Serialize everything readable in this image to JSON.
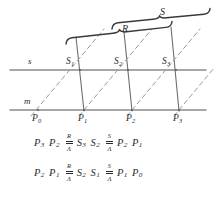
{
  "figure": {
    "lines": [
      {
        "id": "s",
        "label": "s",
        "role": "upper-horizontal-line",
        "y": 70
      },
      {
        "id": "m",
        "label": "m",
        "role": "lower-horizontal-line",
        "y": 110
      }
    ],
    "points_lower": [
      {
        "id": "P0",
        "base": "P",
        "sub": "0",
        "x": 38,
        "y": 110
      },
      {
        "id": "P1",
        "base": "P",
        "sub": "1",
        "x": 83,
        "y": 110
      },
      {
        "id": "P2",
        "base": "P",
        "sub": "2",
        "x": 131,
        "y": 110
      },
      {
        "id": "P3",
        "base": "P",
        "sub": "3",
        "x": 178,
        "y": 110
      }
    ],
    "points_upper": [
      {
        "id": "S1",
        "base": "S",
        "sub": "1",
        "x": 79,
        "y": 70
      },
      {
        "id": "S2",
        "base": "S",
        "sub": "2",
        "x": 128,
        "y": 70
      },
      {
        "id": "S3",
        "base": "S",
        "sub": "3",
        "x": 175,
        "y": 70
      }
    ],
    "braces": [
      {
        "id": "R",
        "label": "R",
        "label_x": 122,
        "label_y": 25,
        "x1": 66,
        "x2": 172,
        "y": 38,
        "peak_x": 120,
        "peak_y": 33,
        "tilt": -9
      },
      {
        "id": "S",
        "label": "S",
        "label_x": 175,
        "label_y": 8,
        "x1": 112,
        "x2": 210,
        "y": 24,
        "peak_x": 160,
        "peak_y": 19,
        "tilt": -9
      }
    ],
    "colors": {
      "ink": "#2b2b2b",
      "line_solid": "#8a8a8a",
      "line_dashed": "#9a9a9a",
      "brace": "#3a3a3a",
      "background": "#ffffff"
    }
  },
  "formulas": {
    "rows": [
      {
        "id": "formula-row-1",
        "terms": [
          {
            "kind": "point",
            "base": "P",
            "sub": "3"
          },
          {
            "kind": "point",
            "base": "P",
            "sub": "2"
          },
          {
            "kind": "projection",
            "top": "R",
            "bottom": "Λ"
          },
          {
            "kind": "point",
            "base": "S",
            "sub": "3"
          },
          {
            "kind": "point",
            "base": "S",
            "sub": "2"
          },
          {
            "kind": "projection",
            "top": "S",
            "bottom": "Λ"
          },
          {
            "kind": "point",
            "base": "P",
            "sub": "2"
          },
          {
            "kind": "point",
            "base": "P",
            "sub": "1"
          }
        ],
        "plain": "P3 P2 R/Λ S3 S2 S/Λ P2 P1"
      },
      {
        "id": "formula-row-2",
        "terms": [
          {
            "kind": "point",
            "base": "P",
            "sub": "2"
          },
          {
            "kind": "point",
            "base": "P",
            "sub": "1"
          },
          {
            "kind": "projection",
            "top": "R",
            "bottom": "Λ"
          },
          {
            "kind": "point",
            "base": "S",
            "sub": "2"
          },
          {
            "kind": "point",
            "base": "S",
            "sub": "1"
          },
          {
            "kind": "projection",
            "top": "S",
            "bottom": "Λ"
          },
          {
            "kind": "point",
            "base": "P",
            "sub": "1"
          },
          {
            "kind": "point",
            "base": "P",
            "sub": "0"
          }
        ],
        "plain": "P2 P1 R/Λ S2 S1 S/Λ P1 P0"
      }
    ]
  }
}
